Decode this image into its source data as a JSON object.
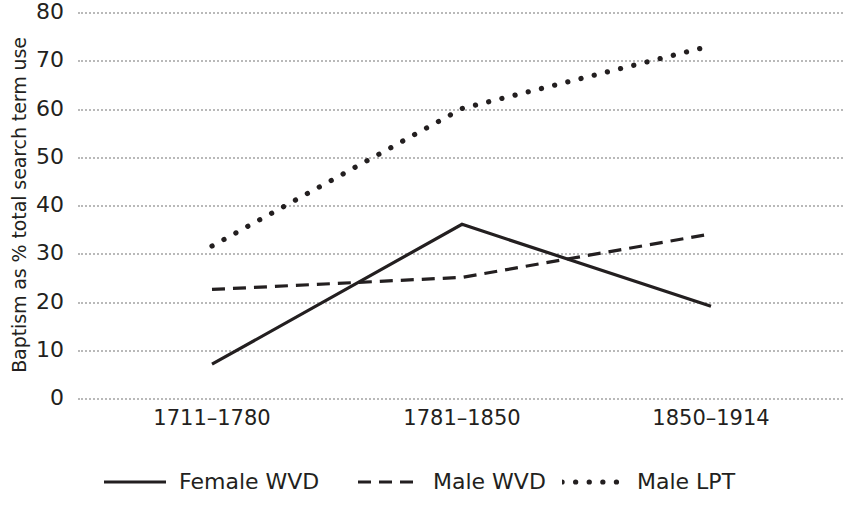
{
  "chart_data": {
    "type": "line",
    "title": "",
    "xlabel": "",
    "ylabel": "Baptism as % total search term use",
    "categories": [
      "1711–1780",
      "1781–1850",
      "1850–1914"
    ],
    "ylim": [
      0,
      80
    ],
    "ytick_step": 10,
    "yticks": [
      80,
      70,
      60,
      50,
      40,
      30,
      20,
      10,
      0
    ],
    "ytick_labels": [
      "80",
      "70",
      "60",
      "50",
      "40",
      "30",
      "20",
      "10",
      "0"
    ],
    "grid": true,
    "grid_style": "dotted",
    "grid_axis": "y",
    "legend_position": "bottom",
    "series": [
      {
        "name": "Female WVD",
        "line_style": "solid",
        "color": "#231f20",
        "values": [
          7,
          36,
          19
        ]
      },
      {
        "name": "Male WVD",
        "line_style": "dashed",
        "color": "#231f20",
        "values": [
          22.5,
          25,
          34
        ]
      },
      {
        "name": "Male LPT",
        "line_style": "dotted",
        "color": "#231f20",
        "values": [
          31.5,
          60,
          73
        ]
      }
    ]
  },
  "colors": {
    "ink": "#231f20",
    "gridline": "#b9b9b9",
    "background": "#ffffff"
  }
}
